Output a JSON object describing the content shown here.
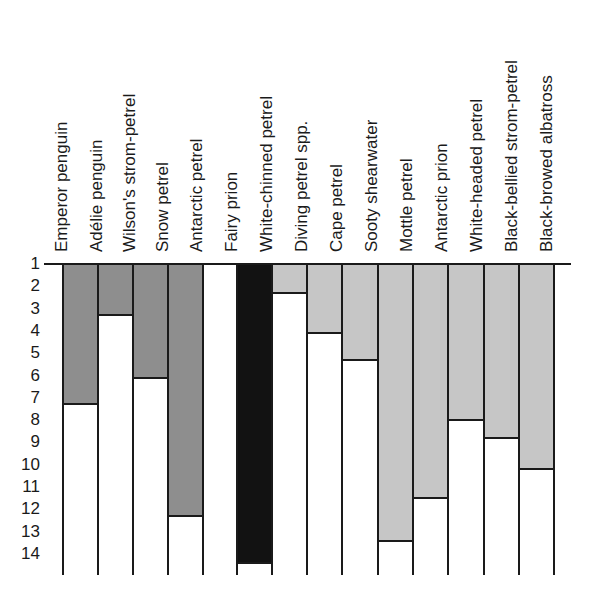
{
  "chart_data": {
    "type": "bar",
    "title": "",
    "xlabel": "",
    "ylabel": "",
    "y_axis": {
      "direction": "top-to-bottom",
      "ticks": [
        "1",
        "2",
        "3",
        "4",
        "5",
        "6",
        "7",
        "8",
        "9",
        "10",
        "11",
        "12",
        "13",
        "14"
      ],
      "ylim": [
        1,
        14.5
      ]
    },
    "categories": [
      "Emperor penguin",
      "Adélie penguin",
      "Wilson's strom-petrel",
      "Snow petrel",
      "Antarctic petrel",
      "Fairy prion",
      "White-chinned petrel",
      "Diving petrel spp.",
      "Cape petrel",
      "Sooty shearwater",
      "Mottle petrel",
      "Antarctic prion",
      "White-headed petrel",
      "Black-bellied strom-petrel",
      "Black-browed albatross"
    ],
    "bars": [
      {
        "fill": "dark-gray",
        "end": 7.3
      },
      {
        "fill": "dark-gray",
        "end": 3.3
      },
      {
        "fill": "dark-gray",
        "end": 6.1
      },
      {
        "fill": "dark-gray",
        "end": 12.3
      },
      {
        "fill": "none",
        "end": 1
      },
      {
        "fill": "black",
        "end": 14.4
      },
      {
        "fill": "light-gray",
        "end": 2.3
      },
      {
        "fill": "light-gray",
        "end": 4.1
      },
      {
        "fill": "light-gray",
        "end": 5.3
      },
      {
        "fill": "light-gray",
        "end": 13.4
      },
      {
        "fill": "light-gray",
        "end": 11.5
      },
      {
        "fill": "light-gray",
        "end": 8.0
      },
      {
        "fill": "light-gray",
        "end": 8.8
      },
      {
        "fill": "light-gray",
        "end": 10.2
      }
    ],
    "colors": {
      "dark-gray": "#8e8e8e",
      "light-gray": "#c6c6c6",
      "black": "#121212",
      "none": "#ffffff"
    },
    "grid": false,
    "legend": null
  },
  "layout": {
    "label_x": [
      52,
      87,
      120,
      153,
      187,
      222,
      257,
      292,
      327,
      362,
      397,
      432,
      467,
      502,
      537
    ],
    "col_edges": [
      63,
      98,
      133,
      168,
      203,
      237,
      272,
      307,
      342,
      378,
      413,
      448,
      484,
      519,
      554
    ],
    "y_top_px": 264,
    "px_per_unit": 22.3
  }
}
